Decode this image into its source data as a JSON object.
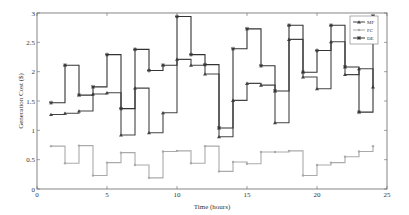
{
  "chart_data": {
    "type": "line",
    "step": true,
    "title": "",
    "xlabel": "Time (hours)",
    "ylabel": "Generation Cost ($)",
    "xlim": [
      0,
      25
    ],
    "ylim": [
      0,
      3
    ],
    "xticks": [
      0,
      5,
      10,
      15,
      20,
      25
    ],
    "yticks": [
      0,
      0.5,
      1,
      1.5,
      2,
      2.5,
      3
    ],
    "ytick_labels": [
      "0",
      "0.5",
      "1",
      "1.5",
      "2",
      "2.5",
      "3"
    ],
    "grid": false,
    "legend_position": "top-right",
    "x": [
      1,
      2,
      3,
      4,
      5,
      6,
      7,
      8,
      9,
      10,
      11,
      12,
      13,
      14,
      15,
      16,
      17,
      18,
      19,
      20,
      21,
      22,
      23,
      24
    ],
    "series": [
      {
        "name": "MF",
        "marker": "triangle",
        "color": "#444444",
        "values": [
          1.27,
          1.29,
          1.33,
          1.62,
          1.64,
          0.92,
          1.72,
          0.96,
          1.3,
          2.21,
          2.11,
          1.96,
          0.89,
          1.51,
          1.8,
          1.77,
          1.13,
          2.55,
          1.91,
          1.71,
          2.51,
          1.95,
          2.05,
          1.74
        ]
      },
      {
        "name": "FC",
        "marker": "dot",
        "color": "#aaaaaa",
        "values": [
          0.73,
          0.44,
          0.74,
          0.23,
          0.45,
          0.62,
          0.41,
          0.19,
          0.64,
          0.65,
          0.44,
          0.73,
          0.3,
          0.46,
          0.43,
          0.63,
          0.63,
          0.65,
          0.23,
          0.41,
          0.45,
          0.55,
          0.64,
          0.73
        ]
      },
      {
        "name": "DE",
        "marker": "star",
        "color": "#333333",
        "values": [
          1.47,
          2.11,
          1.6,
          1.74,
          2.29,
          1.37,
          2.38,
          2.02,
          2.11,
          2.94,
          2.29,
          2.12,
          1.04,
          2.39,
          2.73,
          2.1,
          1.67,
          2.79,
          1.99,
          2.36,
          2.79,
          2.08,
          1.31,
          2.95
        ]
      }
    ]
  }
}
